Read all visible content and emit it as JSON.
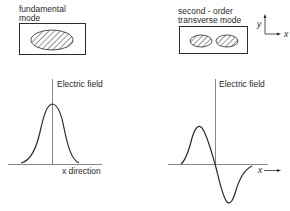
{
  "fundamental": {
    "title_line1": "fundamental",
    "title_line2": "mode",
    "axis_label_y": "Electric field",
    "axis_label_x": "x direction"
  },
  "second_order": {
    "title_line1": "second - order",
    "title_line2": "transverse mode",
    "axis_label_y": "Electric field",
    "axis_label_x": "x"
  },
  "coordinate_axes": {
    "y_label": "y",
    "x_label": "x"
  },
  "colors": {
    "ink": "#2a2a2a",
    "background": "#ffffff"
  }
}
